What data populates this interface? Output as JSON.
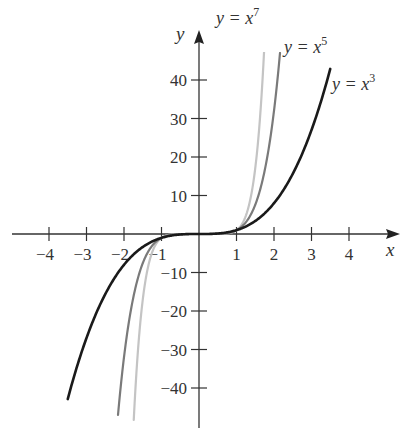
{
  "chart_data": {
    "type": "line",
    "title": "",
    "xlabel": "x",
    "ylabel": "y",
    "xlim": [
      -4.5,
      5
    ],
    "ylim": [
      -50,
      50
    ],
    "grid": false,
    "legend_position": "inline labels near curve ends",
    "x_ticks": [
      -4,
      -3,
      -2,
      -1,
      1,
      2,
      3,
      4
    ],
    "x_tick_labels": [
      "−4",
      "−3",
      "−2",
      "−1",
      "1",
      "2",
      "3",
      "4"
    ],
    "y_ticks": [
      40,
      30,
      20,
      10,
      -10,
      -20,
      -30,
      -40
    ],
    "y_tick_labels": [
      "40",
      "30",
      "20",
      "10",
      "−10",
      "−20",
      "−30",
      "−40"
    ],
    "series": [
      {
        "name": "y = x^3",
        "label_base": "y = x",
        "exponent": "3",
        "power": 3,
        "color": "#1a1a1a",
        "stroke_width": 2.6,
        "x_range": [
          -3.5,
          3.5
        ],
        "values_sample": {
          "x": [
            -3.5,
            -2,
            -1,
            0,
            1,
            2,
            3.5
          ],
          "y": [
            -42.9,
            -8,
            -1,
            0,
            1,
            8,
            42.9
          ]
        }
      },
      {
        "name": "y = x^5",
        "label_base": "y = x",
        "exponent": "5",
        "power": 5,
        "color": "#7a7a7a",
        "stroke_width": 2.2,
        "x_range": [
          -2.16,
          2.16
        ],
        "values_sample": {
          "x": [
            -2.16,
            -2,
            -1,
            0,
            1,
            2,
            2.16
          ],
          "y": [
            -47,
            -32,
            -1,
            0,
            1,
            32,
            47
          ]
        }
      },
      {
        "name": "y = x^7",
        "label_base": "y = x",
        "exponent": "7",
        "power": 7,
        "color": "#c4c4c4",
        "stroke_width": 2.2,
        "x_range": [
          -1.74,
          1.74
        ],
        "values_sample": {
          "x": [
            -1.74,
            -1.5,
            -1,
            0,
            1,
            1.5,
            1.74
          ],
          "y": [
            -48.3,
            -17.1,
            -1,
            0,
            1,
            17.1,
            48.3
          ]
        }
      }
    ]
  }
}
